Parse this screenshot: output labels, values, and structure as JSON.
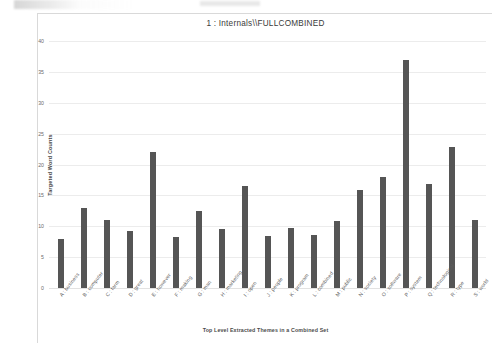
{
  "figure": {
    "title": "1 : Internals\\\\FULLCOMBINED"
  },
  "chart_data": {
    "type": "bar",
    "title": "1 : Internals\\\\FULLCOMBINED",
    "xlabel": "Top Level Extracted Themes in a Combined Set",
    "ylabel": "Targeted Word Counts",
    "ylim": [
      0,
      40
    ],
    "yticks": [
      0,
      5,
      10,
      15,
      20,
      25,
      30,
      35,
      40
    ],
    "grid": true,
    "legend": null,
    "bar_color": "#555555",
    "categories": [
      "A : business",
      "B : computer",
      "C : farm",
      "D : great",
      "E : however",
      "F : making",
      "G : man",
      "H : marketing",
      "I : open",
      "J : people",
      "K : program",
      "L : combined",
      "M : public",
      "N : society",
      "O : software",
      "P : system",
      "Q : technological",
      "R : type",
      "S : world"
    ],
    "values": [
      8,
      13,
      11,
      9.3,
      22,
      8.3,
      12.5,
      9.5,
      16.5,
      8.5,
      9.8,
      8.6,
      10.8,
      15.8,
      18,
      37,
      16.8,
      22.8,
      11
    ]
  }
}
